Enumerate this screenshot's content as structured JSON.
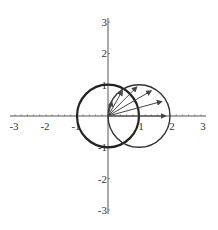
{
  "diagram": {
    "type": "polar-plot",
    "x_axis": {
      "range": [
        -3,
        3
      ],
      "ticks": [
        "-3",
        "-2",
        "-1",
        "1",
        "2",
        "3"
      ],
      "tick_values": [
        -3,
        -2,
        -1,
        1,
        2,
        3
      ]
    },
    "y_axis": {
      "range": [
        -3,
        3
      ],
      "ticks": [
        "3",
        "2",
        "1",
        "-1",
        "-2",
        "-3"
      ],
      "tick_values": [
        3,
        2,
        1,
        -1,
        -2,
        -3
      ]
    },
    "circles": [
      {
        "name": "unit-circle",
        "center": [
          0,
          0
        ],
        "radius": 1,
        "color": "#222222",
        "weight": "thick"
      },
      {
        "name": "shifted-circle",
        "center": [
          1,
          0
        ],
        "radius": 1,
        "color": "#333333",
        "weight": "normal"
      }
    ],
    "vectors": {
      "origin": [
        0,
        0
      ],
      "angles_deg": [
        0,
        15,
        30,
        45,
        60,
        75
      ],
      "curve": "r = 2cos(theta)",
      "color": "#444444"
    }
  }
}
